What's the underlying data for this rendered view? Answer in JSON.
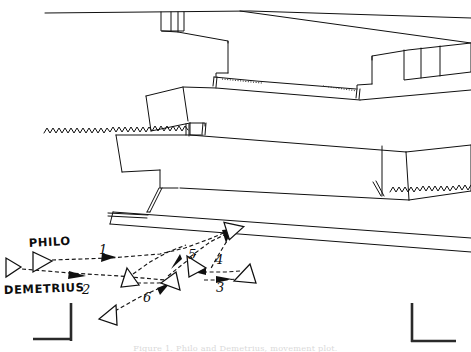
{
  "figure": {
    "caption": "Figure 1. Philo and Demetrius, movement plot.",
    "background_color": "#ffffff",
    "ink_color": "#101010"
  },
  "actor_labels": [
    {
      "id": "philo",
      "text": "PHILO",
      "x": 29,
      "y": 247
    },
    {
      "id": "demetrius",
      "text": "DEMETRIUS",
      "x": 4,
      "y": 294
    }
  ],
  "cue_numbers": [
    {
      "id": "cue-1",
      "text": "1",
      "x": 99,
      "y": 254
    },
    {
      "id": "cue-2",
      "text": "2",
      "x": 82,
      "y": 294
    },
    {
      "id": "cue-3",
      "text": "3",
      "x": 216,
      "y": 292
    },
    {
      "id": "cue-4",
      "text": "4",
      "x": 215,
      "y": 264
    },
    {
      "id": "cue-5",
      "text": "5",
      "x": 188,
      "y": 259
    },
    {
      "id": "cue-6",
      "text": "6",
      "x": 143,
      "y": 302
    }
  ],
  "actors": [
    {
      "id": "demetrius-start",
      "label": "Demetrius start position",
      "cx": 13,
      "cy": 267,
      "rot": 0
    },
    {
      "id": "philo-start",
      "label": "Philo start position",
      "cx": 41,
      "cy": 262,
      "rot": 0
    },
    {
      "id": "philo-upstage",
      "label": "Philo upstage position",
      "cx": 234,
      "cy": 229,
      "rot": -28
    },
    {
      "id": "philo-mid",
      "label": "Philo mid position",
      "cx": 196,
      "cy": 265,
      "rot": 12
    },
    {
      "id": "demetrius-right",
      "label": "Demetrius right position",
      "cx": 243,
      "cy": 274,
      "rot": 0
    },
    {
      "id": "demetrius-center",
      "label": "Demetrius center position",
      "cx": 171,
      "cy": 284,
      "rot": 0
    },
    {
      "id": "philo-down",
      "label": "Philo downstage position",
      "cx": 130,
      "cy": 280,
      "rot": 18
    },
    {
      "id": "demetrius-downleft",
      "label": "Demetrius downstage left position",
      "cx": 108,
      "cy": 315,
      "rot": -12
    }
  ],
  "set_elements": [
    {
      "id": "upstage-wall",
      "label": "Upstage back wall"
    },
    {
      "id": "platform-upper",
      "label": "Upper platform unit"
    },
    {
      "id": "platform-middle",
      "label": "Middle platform unit"
    },
    {
      "id": "platform-lower",
      "label": "Lower platform unit"
    },
    {
      "id": "stage-apron",
      "label": "Stage apron"
    },
    {
      "id": "curtain-left",
      "label": "Left curtain leg"
    },
    {
      "id": "curtain-right",
      "label": "Right curtain leg"
    },
    {
      "id": "wing-left",
      "label": "Left wing marker"
    },
    {
      "id": "wing-right",
      "label": "Right wing marker"
    },
    {
      "id": "step-unit-left",
      "label": "Left step unit"
    },
    {
      "id": "step-unit-right",
      "label": "Right step unit"
    }
  ]
}
